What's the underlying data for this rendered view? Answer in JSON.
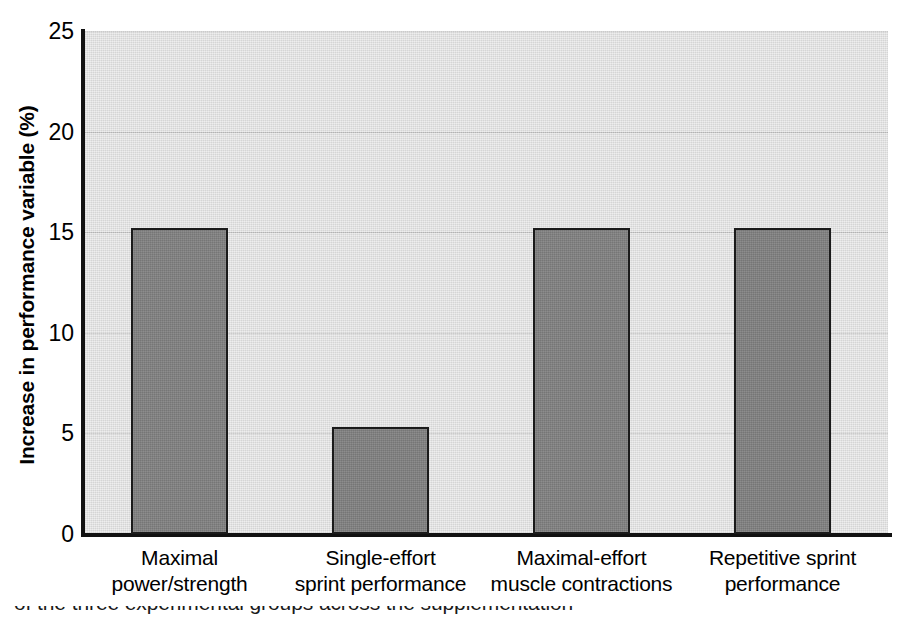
{
  "chart_data": {
    "type": "bar",
    "title": "",
    "xlabel": "",
    "ylabel": "Increase in performance variable (%)",
    "categories": [
      "Maximal power/strength",
      "Single-effort sprint performance",
      "Maximal-effort muscle contractions",
      "Repetitive sprint performance"
    ],
    "category_lines": [
      [
        "Maximal",
        "power/strength"
      ],
      [
        "Single-effort",
        "sprint performance"
      ],
      [
        "Maximal-effort",
        "muscle contractions"
      ],
      [
        "Repetitive sprint",
        "performance"
      ]
    ],
    "values": [
      15.2,
      5.3,
      15.2,
      15.2
    ],
    "ylim": [
      0,
      25
    ],
    "yticks": [
      0,
      5,
      10,
      15,
      20,
      25
    ],
    "ytick_labels": [
      "0",
      "5",
      "10",
      "15",
      "20",
      "25"
    ],
    "grid": true,
    "grid_axis": "y",
    "legend": "none",
    "colors": {
      "bar_fill": "#808080",
      "bar_edge": "#1b1b1b",
      "plot_background": "#dddddd",
      "gridline": "#b9b9b9",
      "axis_line": "#111111",
      "text": "#000000",
      "figure_background": "#ffffff"
    }
  },
  "caption": {
    "clipped_line": "of the three experimental groups across the supplementation"
  }
}
